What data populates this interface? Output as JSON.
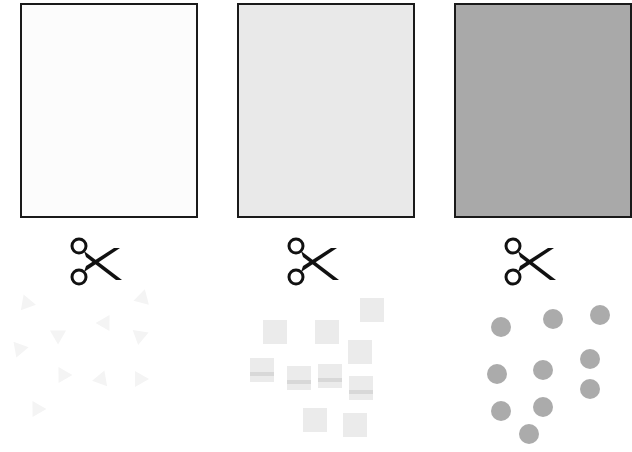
{
  "columns": [
    {
      "name": "white",
      "sheet_color": "#fcfcfc",
      "piece_shape": "triangle",
      "piece_color": "#f3f3f3",
      "x": 20
    },
    {
      "name": "light-gray",
      "sheet_color": "#e9e9e9",
      "piece_shape": "square",
      "piece_color": "#ebebeb",
      "x": 237
    },
    {
      "name": "dark-gray",
      "sheet_color": "#a9a9a9",
      "piece_shape": "circle",
      "piece_color": "#ababab",
      "x": 454
    }
  ],
  "icons": {
    "cut": "scissors-icon"
  }
}
